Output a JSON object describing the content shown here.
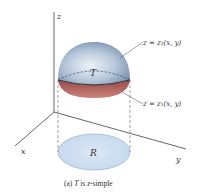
{
  "figure": {
    "caption": {
      "prefix": "(a) ",
      "T": "T",
      "middle": " is ",
      "z": "z",
      "suffix": "-simple"
    },
    "axes": {
      "x_label": "x",
      "y_label": "y",
      "z_label": "z"
    },
    "solid_label": "T",
    "region_label": "R",
    "upper_surface_label": "z = z₂(x, y)",
    "lower_surface_label": "z = z₁(x, y)",
    "colors": {
      "upper_surface": "#8fa6c4",
      "upper_highlight": "#eef3f8",
      "lower_surface": "#b5605a",
      "region_fill": "#cfe0f2",
      "region_stroke": "#8aa9cc",
      "axis": "#555555"
    }
  }
}
